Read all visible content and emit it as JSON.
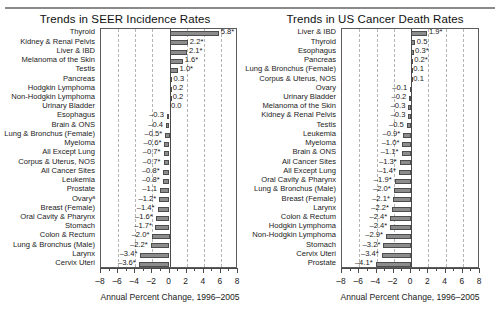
{
  "figure": {
    "width": 500,
    "height": 318,
    "bar_color": "#8c8c8c",
    "bar_edge_color": "#4d4d4d",
    "grid_color": "#b5b5b5",
    "axis_color": "#4a4a4a"
  },
  "chart_data": [
    {
      "type": "bar",
      "orientation": "horizontal",
      "title": "Trends in SEER Incidence Rates",
      "xlabel": "Annual Percent Change, 1996–2005",
      "ylabel": "",
      "xlim": [
        -8,
        8
      ],
      "xticks": [
        -8,
        -6,
        -4,
        -2,
        0,
        2,
        4,
        6,
        8
      ],
      "xticklabels": [
        "–8",
        "–6",
        "–4",
        "–2",
        "0",
        "2",
        "4",
        "6",
        "8"
      ],
      "grid": true,
      "gridlines": [
        -6,
        -4,
        -2,
        2,
        4,
        6
      ],
      "legend": "none",
      "categories": [
        "Thyroid",
        "Kidney & Renal Pelvis",
        "Liver & IBD",
        "Melanoma of the Skin",
        "Testis",
        "Pancreas",
        "Hodgkin Lymphoma",
        "Non-Hodgkin Lymphoma",
        "Urinary Bladder",
        "Esophagus",
        "Brain & ONS",
        "Lung & Bronchus (Female)",
        "Myeloma",
        "All Except Lung",
        "Corpus & Uterus, NOS",
        "All Cancer Sites",
        "Leukemia",
        "Prostate",
        "Ovaryᵃ",
        "Breast (Female)",
        "Oral Cavity & Pharynx",
        "Stomach",
        "Colon & Rectum",
        "Lung & Bronchus (Male)",
        "Larynx",
        "Cervix Uteri"
      ],
      "values": [
        5.8,
        2.2,
        2.1,
        1.6,
        1.0,
        0.3,
        0.2,
        0.2,
        0.0,
        -0.3,
        -0.4,
        -0.5,
        -0.6,
        -0.7,
        -0.7,
        -0.8,
        -0.8,
        -1.1,
        -1.2,
        -1.4,
        -1.6,
        -1.7,
        -2.0,
        -2.2,
        -3.4,
        -3.6
      ],
      "value_labels": [
        "5.8*",
        "2.2*",
        "2.1*",
        "1.6*",
        "1.0*",
        "0.3",
        "0.2",
        "0.2",
        "0.0",
        "–0.3",
        "–0.4",
        "–0.5*",
        "–0.6*",
        "–0.7*",
        "–0.7*",
        "–0.8*",
        "–0.8*",
        "–1.1",
        "–1.2*",
        "–1.4*",
        "–1.6*",
        "–1.7*",
        "–2.0*",
        "–2.2*",
        "–3.4*",
        "–3.6*"
      ]
    },
    {
      "type": "bar",
      "orientation": "horizontal",
      "title": "Trends in US Cancer Death Rates",
      "xlabel": "Annual Percent Change, 1996–2005",
      "ylabel": "",
      "xlim": [
        -8,
        8
      ],
      "xticks": [
        -8,
        -6,
        -4,
        -2,
        0,
        2,
        4,
        6,
        8
      ],
      "xticklabels": [
        "–8",
        "–6",
        "–4",
        "–2",
        "0",
        "2",
        "4",
        "6",
        "8"
      ],
      "grid": true,
      "gridlines": [
        -6,
        -4,
        -2,
        2,
        4,
        6
      ],
      "legend": "none",
      "categories": [
        "Liver & IBD",
        "Thyroid",
        "Esophagus",
        "Pancreas",
        "Lung & Bronchus (Female)",
        "Corpus & Uterus, NOS",
        "Ovary",
        "Urinary Bladder",
        "Melanoma of the Skin",
        "Kidney & Renal Pelvis",
        "Testis",
        "Leukemia",
        "Myeloma",
        "Brain & ONS",
        "All Cancer Sites",
        "All Except Lung",
        "Oral Cavity & Pharynx",
        "Lung & Bronchus (Male)",
        "Breast (Female)",
        "Larynx",
        "Colon & Rectum",
        "Hodgkin Lymphoma",
        "Non-Hodgkin Lymphoma",
        "Stomach",
        "Cervix Uteri",
        "Prostate"
      ],
      "values": [
        1.9,
        0.5,
        0.3,
        0.2,
        0.1,
        0.1,
        -0.1,
        -0.2,
        -0.3,
        -0.3,
        -0.5,
        -0.9,
        -1.0,
        -1.1,
        -1.3,
        -1.4,
        -1.9,
        -2.0,
        -2.1,
        -2.2,
        -2.4,
        -2.4,
        -2.9,
        -3.2,
        -3.4,
        -4.1
      ],
      "value_labels": [
        "1.9*",
        "0.5",
        "0.3*",
        "0.2*",
        "0.1",
        "0.1",
        "–0.1",
        "–0.2",
        "–0.3",
        "–0.3",
        "–0.5",
        "–0.9*",
        "–1.0*",
        "–1.1*",
        "–1.3*",
        "–1.4*",
        "–1.9*",
        "–2.0*",
        "–2.1*",
        "–2.2*",
        "–2.4*",
        "–2.4*",
        "–2.9*",
        "–3.2*",
        "–3.4*",
        "–4.1*"
      ]
    }
  ]
}
